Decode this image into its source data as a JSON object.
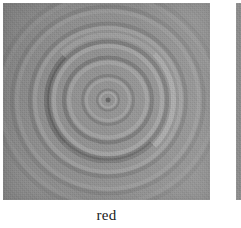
{
  "figure": {
    "background_color": "#ffffff",
    "panels": [
      {
        "id": "red",
        "caption": "red",
        "kind": "grayscale-interferogram",
        "description": "Concentric embossed ring pattern (Newton's-rings style interference fringes) rendered in grayscale with directional relief shading",
        "base_color": "#8b8b8b",
        "highlight_color": "#d2d2d2",
        "shadow_color": "#545454",
        "ring_count": 7,
        "center": {
          "x_pct": 50.5,
          "y_pct": 49
        },
        "cropped": false
      },
      {
        "id": "next-panel",
        "caption": "",
        "kind": "grayscale-interferogram",
        "description": "Left sliver of the adjacent figure panel, cropped by the screenshot edge",
        "base_color": "#8c8c8c",
        "cropped": true
      }
    ]
  },
  "chart_data": {
    "type": "heatmap",
    "title": "",
    "subtitle": "",
    "xlabel": "",
    "ylabel": "",
    "annotations": [
      "red"
    ],
    "legend": [],
    "grid": false,
    "colormap": "grayscale",
    "value_range": [
      84,
      210
    ],
    "center": {
      "x": 105,
      "y": 100
    },
    "ring_radii_px": [
      9,
      23,
      41,
      56,
      75,
      93,
      109
    ],
    "ring_intensity": [
      196,
      188,
      194,
      201,
      186,
      174,
      166
    ],
    "ring_shadow_intensity": [
      112,
      112,
      104,
      108,
      118,
      128,
      136
    ],
    "background_intensity": 139
  }
}
